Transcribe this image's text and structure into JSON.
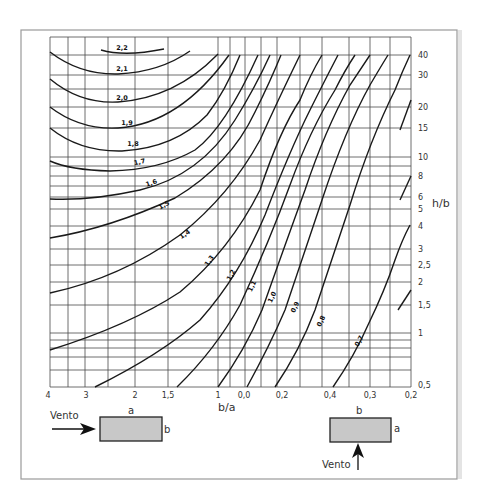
{
  "chart_data": {
    "type": "line",
    "title": "",
    "xlabel": "b/a",
    "ylabel": "h/b",
    "x_ticks": [
      "4",
      "3",
      "2",
      "1,5",
      "1",
      "0,0",
      "0,2",
      "0,4",
      "0,3",
      "0,2"
    ],
    "y_ticks": [
      "40",
      "30",
      "20",
      "15",
      "10",
      "8",
      "6",
      "5",
      "4",
      "3",
      "2,5",
      "2",
      "1,5",
      "1",
      "0,5"
    ],
    "yscale": "log",
    "ylim": [
      0.5,
      50
    ],
    "grid": true,
    "series": [
      {
        "name": "2,2",
        "label": "2,2"
      },
      {
        "name": "2,1",
        "label": "2,1"
      },
      {
        "name": "2,0",
        "label": "2,0"
      },
      {
        "name": "1,9",
        "label": "1,9"
      },
      {
        "name": "1,8",
        "label": "1,8"
      },
      {
        "name": "1,7",
        "label": "1,7"
      },
      {
        "name": "1,6",
        "label": "1,6"
      },
      {
        "name": "1,5",
        "label": "1,5"
      },
      {
        "name": "1,4",
        "label": "1,4"
      },
      {
        "name": "1,3",
        "label": "1,3"
      },
      {
        "name": "1,2",
        "label": "1,2"
      },
      {
        "name": "1,1",
        "label": "1,1"
      },
      {
        "name": "1,0",
        "label": "1,0"
      },
      {
        "name": "0,9",
        "label": "0,9"
      },
      {
        "name": "0,8",
        "label": "0,8"
      },
      {
        "name": "0,7",
        "label": "0,7"
      }
    ],
    "annotations": [
      {
        "text": "Vento",
        "note": "wind arrow pointing right onto side b of rectangle a×b"
      },
      {
        "text": "Vento",
        "note": "wind arrow pointing up onto side b of rectangle b×a"
      }
    ]
  },
  "axes": {
    "xlabel": "b/a",
    "ylabel": "h/b",
    "x_ticks": [
      {
        "label": "4",
        "x": 48
      },
      {
        "label": "3",
        "x": 86
      },
      {
        "label": "2",
        "x": 135
      },
      {
        "label": "1,5",
        "x": 168
      },
      {
        "label": "1",
        "x": 218
      },
      {
        "label": "0,0",
        "x": 244
      },
      {
        "label": "0,2",
        "x": 282
      },
      {
        "label": "0,4",
        "x": 330
      },
      {
        "label": "0,3",
        "x": 370
      },
      {
        "label": "0,2",
        "x": 411
      }
    ],
    "y_ticks": [
      {
        "label": "40",
        "y": 55
      },
      {
        "label": "30",
        "y": 75
      },
      {
        "label": "20",
        "y": 107
      },
      {
        "label": "15",
        "y": 128
      },
      {
        "label": "10",
        "y": 157
      },
      {
        "label": "8",
        "y": 176
      },
      {
        "label": "6",
        "y": 197
      },
      {
        "label": "5",
        "y": 209
      },
      {
        "label": "4",
        "y": 226
      },
      {
        "label": "3",
        "y": 249
      },
      {
        "label": "2,5",
        "y": 265
      },
      {
        "label": "2",
        "y": 282
      },
      {
        "label": "1,5",
        "y": 305
      },
      {
        "label": "1",
        "y": 333
      },
      {
        "label": "0,5",
        "y": 385
      }
    ]
  },
  "curve_labels": [
    {
      "text": "2,2",
      "x": 122,
      "y": 50,
      "rot": 0
    },
    {
      "text": "2,1",
      "x": 122,
      "y": 71,
      "rot": 0
    },
    {
      "text": "2,0",
      "x": 122,
      "y": 100,
      "rot": 0
    },
    {
      "text": "1,9",
      "x": 127,
      "y": 125,
      "rot": 0
    },
    {
      "text": "1,8",
      "x": 133,
      "y": 146,
      "rot": 0
    },
    {
      "text": "1,7",
      "x": 140,
      "y": 164,
      "rot": -12
    },
    {
      "text": "1,6",
      "x": 152,
      "y": 185,
      "rot": -18
    },
    {
      "text": "1,5",
      "x": 165,
      "y": 207,
      "rot": -28
    },
    {
      "text": "1,4",
      "x": 186,
      "y": 236,
      "rot": -35
    },
    {
      "text": "1,3",
      "x": 211,
      "y": 262,
      "rot": -55
    },
    {
      "text": "1,2",
      "x": 233,
      "y": 276,
      "rot": -62
    },
    {
      "text": "1,1",
      "x": 254,
      "y": 287,
      "rot": -64
    },
    {
      "text": "1,0",
      "x": 274,
      "y": 298,
      "rot": -64
    },
    {
      "text": "0,9",
      "x": 297,
      "y": 308,
      "rot": -64
    },
    {
      "text": "0,8",
      "x": 323,
      "y": 322,
      "rot": -64
    },
    {
      "text": "0,7",
      "x": 361,
      "y": 342,
      "rot": -62
    }
  ],
  "diagram_left": {
    "wind_label": "Vento",
    "top_label": "a",
    "side_label": "b"
  },
  "diagram_right": {
    "wind_label": "Vento",
    "top_label": "b",
    "side_label": "a"
  },
  "colors": {
    "box_fill": "#c8c8c8",
    "grid": "#4a4a4a",
    "curve": "#1a1a1a",
    "frame": "#9a9a9a"
  }
}
